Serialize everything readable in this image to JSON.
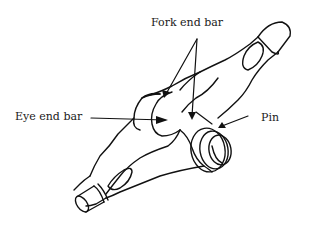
{
  "diagram": {
    "type": "labeled line drawing",
    "labels": {
      "fork_end_bar": "Fork end bar",
      "eye_end_bar": "Eye end bar",
      "pin": "Pin"
    },
    "colors": {
      "line": "#111111",
      "background": "#ffffff",
      "text": "#1a1a1a"
    }
  }
}
